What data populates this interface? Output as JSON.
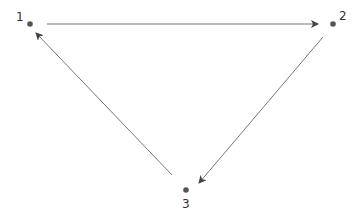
{
  "diagram": {
    "type": "directed-cycle-graph",
    "nodes": [
      {
        "id": "1",
        "label": "1",
        "x": 30,
        "y": 24
      },
      {
        "id": "2",
        "label": "2",
        "x": 333,
        "y": 24
      },
      {
        "id": "3",
        "label": "3",
        "x": 186,
        "y": 190
      }
    ],
    "edges": [
      {
        "from": "1",
        "to": "2"
      },
      {
        "from": "2",
        "to": "3"
      },
      {
        "from": "3",
        "to": "1"
      }
    ],
    "colors": {
      "node": "#555555",
      "edge": "#666666",
      "label": "#333333"
    }
  }
}
